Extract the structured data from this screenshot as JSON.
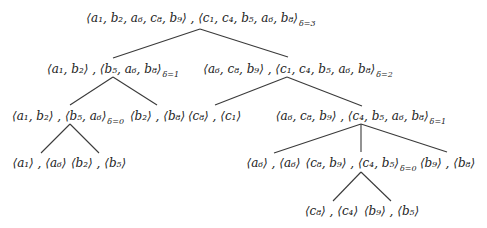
{
  "diagram": {
    "type": "tree",
    "nodes": {
      "root": {
        "label": "⟨a₁, b₂, a₆, c₈, b₉⟩ , ⟨c₁, c₄, b₅, a₆, b₈⟩",
        "delta": "δ=3"
      },
      "l1_left": {
        "label": "⟨a₁, b₂⟩ , ⟨b₅, a₆, b₈⟩",
        "delta": "δ=1"
      },
      "l1_right": {
        "label": "⟨a₆, c₈, b₉⟩ , ⟨c₁, c₄, b₅, a₆, b₈⟩",
        "delta": "δ=2"
      },
      "l2_a": {
        "label": "⟨a₁, b₂⟩ , ⟨b₅, a₆⟩",
        "delta": "δ=0"
      },
      "l2_b": {
        "label": "⟨b₂⟩ , ⟨b₈⟩",
        "delta": ""
      },
      "l2_c": {
        "label": "⟨c₈⟩ , ⟨c₁⟩",
        "delta": ""
      },
      "l2_d": {
        "label": "⟨a₆, c₈, b₉⟩ , ⟨c₄, b₅, a₆, b₈⟩",
        "delta": "δ=1"
      },
      "l3_a": {
        "label": "⟨a₁⟩ , ⟨a₆⟩",
        "delta": ""
      },
      "l3_b": {
        "label": "⟨b₂⟩ , ⟨b₅⟩",
        "delta": ""
      },
      "l3_c": {
        "label": "⟨a₆⟩ , ⟨a₆⟩",
        "delta": ""
      },
      "l3_d": {
        "label": "⟨c₈, b₉⟩ , ⟨c₄, b₅⟩",
        "delta": "δ=0"
      },
      "l3_e": {
        "label": "⟨b₉⟩ , ⟨b₈⟩",
        "delta": ""
      },
      "l4_a": {
        "label": "⟨c₈⟩ , ⟨c₄⟩",
        "delta": ""
      },
      "l4_b": {
        "label": "⟨b₉⟩ , ⟨b₅⟩",
        "delta": ""
      }
    },
    "edges": [
      [
        "root",
        "l1_left"
      ],
      [
        "root",
        "l1_right"
      ],
      [
        "l1_left",
        "l2_a"
      ],
      [
        "l1_left",
        "l2_b"
      ],
      [
        "l1_right",
        "l2_c"
      ],
      [
        "l1_right",
        "l2_d"
      ],
      [
        "l2_a",
        "l3_a"
      ],
      [
        "l2_a",
        "l3_b"
      ],
      [
        "l2_d",
        "l3_c"
      ],
      [
        "l2_d",
        "l3_d"
      ],
      [
        "l2_d",
        "l3_e"
      ],
      [
        "l3_d",
        "l4_a"
      ],
      [
        "l3_d",
        "l4_b"
      ]
    ]
  }
}
